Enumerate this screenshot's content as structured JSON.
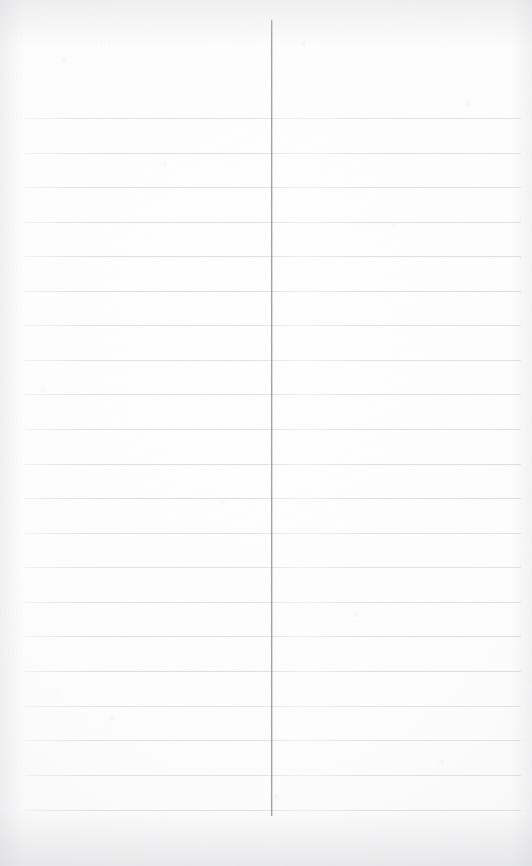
{
  "document": {
    "kind": "blank-ruled-notebook-page",
    "title": "Blank Ruled Notebook Page",
    "width": 532,
    "height": 866,
    "background_color": "#fcfcfc",
    "text_content": "",
    "visible_text": []
  },
  "paper": {
    "base_color": "#ffffff",
    "shade_color": "#f2f2f3",
    "grain_color": "#a8aaae",
    "edge_shadow_color": "#cdcfd3"
  },
  "ruling": {
    "horizontal": {
      "color": "#d9dde1",
      "thickness_px": 1,
      "count": 21,
      "first_y": 118,
      "spacing_px": 34.6,
      "left_x": 25,
      "right_x": 521,
      "y_positions": [
        118,
        153,
        187,
        222,
        256,
        291,
        325,
        360,
        394,
        429,
        464,
        498,
        533,
        567,
        602,
        636,
        671,
        706,
        740,
        775,
        810
      ]
    },
    "vertical_margin": {
      "color": "#9b9c9e",
      "thickness_px": 1,
      "x": 271,
      "top_y": 20,
      "bottom_y": 816
    }
  }
}
